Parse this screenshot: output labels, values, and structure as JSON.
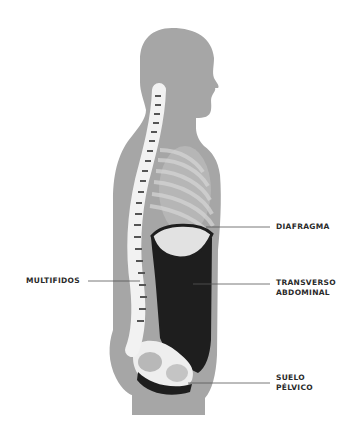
{
  "diagram": {
    "type": "anatomical-side-view",
    "colors": {
      "background": "#ffffff",
      "silhouette": "#a6a6a6",
      "ribs": "#c8c8c8",
      "spine_bone": "#f2f2f2",
      "muscle": "#1e1e1e",
      "leader_line": "#555555",
      "label_text": "#2a2a2a"
    }
  },
  "labels": {
    "diafragma": "DIAFRAGMA",
    "transverso_line1": "TRANSVERSO",
    "transverso_line2": "ABDOMINAL",
    "multifidos": "MULTIFIDOS",
    "suelo_line1": "SUELO",
    "suelo_line2": "PÉLVICO"
  }
}
